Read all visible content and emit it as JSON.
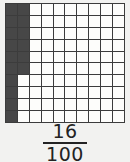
{
  "figure": {
    "grid": {
      "rows": 10,
      "columns": 10,
      "total_cells": 100,
      "shaded_cells": 16,
      "shaded_description": "column 1 fully shaded (10 cells); column 2 shaded in rows 1-6 (6 cells)",
      "shaded_coordinates": [
        [
          1,
          1
        ],
        [
          2,
          1
        ],
        [
          3,
          1
        ],
        [
          4,
          1
        ],
        [
          5,
          1
        ],
        [
          6,
          1
        ],
        [
          7,
          1
        ],
        [
          8,
          1
        ],
        [
          9,
          1
        ],
        [
          10,
          1
        ],
        [
          1,
          2
        ],
        [
          2,
          2
        ],
        [
          3,
          2
        ],
        [
          4,
          2
        ],
        [
          5,
          2
        ],
        [
          6,
          2
        ]
      ],
      "shaded_color": "#474747",
      "unshaded_color": "#fdfdfb",
      "line_color": "#3c3c3c"
    },
    "fraction": {
      "numerator": "16",
      "denominator": "100",
      "bar_color": "#232323"
    },
    "background_color": "#f2f2f0"
  },
  "chart_data": {
    "type": "heatmap",
    "title": "16/100",
    "rows": 10,
    "columns": 10,
    "categories": [
      "1",
      "2",
      "3",
      "4",
      "5",
      "6",
      "7",
      "8",
      "9",
      "10"
    ],
    "values": [
      [
        1,
        1,
        0,
        0,
        0,
        0,
        0,
        0,
        0,
        0
      ],
      [
        1,
        1,
        0,
        0,
        0,
        0,
        0,
        0,
        0,
        0
      ],
      [
        1,
        1,
        0,
        0,
        0,
        0,
        0,
        0,
        0,
        0
      ],
      [
        1,
        1,
        0,
        0,
        0,
        0,
        0,
        0,
        0,
        0
      ],
      [
        1,
        1,
        0,
        0,
        0,
        0,
        0,
        0,
        0,
        0
      ],
      [
        1,
        1,
        0,
        0,
        0,
        0,
        0,
        0,
        0,
        0
      ],
      [
        1,
        0,
        0,
        0,
        0,
        0,
        0,
        0,
        0,
        0
      ],
      [
        1,
        0,
        0,
        0,
        0,
        0,
        0,
        0,
        0,
        0
      ],
      [
        1,
        0,
        0,
        0,
        0,
        0,
        0,
        0,
        0,
        0
      ],
      [
        1,
        0,
        0,
        0,
        0,
        0,
        0,
        0,
        0,
        0
      ]
    ],
    "shaded_count": 16,
    "total_count": 100,
    "fraction_text": "16/100",
    "xlabel": "",
    "ylabel": "",
    "grid": true,
    "legend": false
  }
}
